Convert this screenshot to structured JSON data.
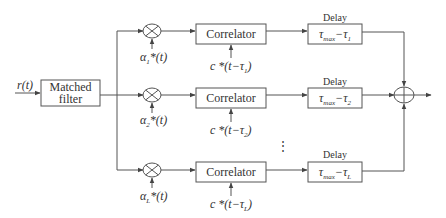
{
  "diagram": {
    "type": "block-diagram",
    "input": {
      "label": "r(t)",
      "sym": "r",
      "arg": "(t)"
    },
    "matched_filter": {
      "line1": "Matched",
      "line2": "filter"
    },
    "branches": [
      {
        "index": 1,
        "weight": {
          "sym": "α",
          "sub": "1",
          "tail": "*(t)"
        },
        "correlator": {
          "label": "Correlator"
        },
        "code": {
          "head": "c *(t−τ",
          "sub": "1",
          "tail": ")"
        },
        "delay": {
          "title": "Delay",
          "tau": "τ",
          "max": "max",
          "minus": "−τ",
          "sub": "1"
        }
      },
      {
        "index": 2,
        "weight": {
          "sym": "α",
          "sub": "2",
          "tail": "*(t)"
        },
        "correlator": {
          "label": "Correlator"
        },
        "code": {
          "head": "c *(t−τ",
          "sub": "2",
          "tail": ")"
        },
        "delay": {
          "title": "Delay",
          "tau": "τ",
          "max": "max",
          "minus": "−τ",
          "sub": "2"
        }
      },
      {
        "index": "L",
        "weight": {
          "sym": "α",
          "sub": "L",
          "tail": "*(t)"
        },
        "correlator": {
          "label": "Correlator"
        },
        "code": {
          "head": "c *(t−τ",
          "sub": "L",
          "tail": ")"
        },
        "delay": {
          "title": "Delay",
          "tau": "τ",
          "max": "max",
          "minus": "−τ",
          "sub": "L"
        }
      }
    ],
    "ellipsis": "⋮",
    "summer": {
      "symbol": "plus-circle"
    },
    "colors": {
      "stroke": "#555555",
      "text": "#333333",
      "background": "#ffffff"
    }
  }
}
